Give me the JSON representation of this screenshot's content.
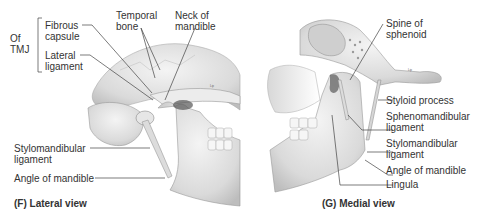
{
  "panel_f": {
    "caption": "(F)  Lateral view",
    "group_label_line1": "Of",
    "group_label_line2": "TMJ",
    "labels": {
      "fibrous_capsule_1": "Fibrous",
      "fibrous_capsule_2": "capsule",
      "lateral_ligament_1": "Lateral",
      "lateral_ligament_2": "ligament",
      "temporal_bone_1": "Temporal",
      "temporal_bone_2": "bone",
      "neck_of_mandible_1": "Neck of",
      "neck_of_mandible_2": "mandible",
      "stylomandibular_1": "Stylomandibular",
      "stylomandibular_2": "ligament",
      "angle_of_mandible": "Angle of mandible"
    },
    "tiny_mark": "Lip"
  },
  "panel_g": {
    "caption": "(G) Medial view",
    "labels": {
      "spine_of_sphenoid_1": "Spine of",
      "spine_of_sphenoid_2": "sphenoid",
      "styloid_process": "Styloid process",
      "sphenomandibular_1": "Sphenomandibular",
      "sphenomandibular_2": "ligament",
      "stylomandibular_1": "Stylomandibular",
      "stylomandibular_2": "ligament",
      "angle_of_mandible": "Angle of mandible",
      "lingula": "Lingula"
    },
    "tiny_mark": "Lip"
  },
  "colors": {
    "bone_fill": "#e4e4e4",
    "bone_shadow": "#b8b8b8",
    "leader_line": "#444444",
    "text": "#333333"
  }
}
